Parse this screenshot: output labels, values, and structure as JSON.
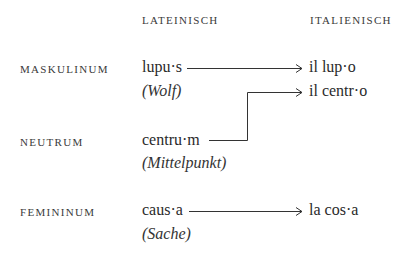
{
  "headers": {
    "latin": "LATEINISCH",
    "italian": "ITALIENISCH"
  },
  "rows": [
    {
      "gender": "MASKULINUM",
      "latin": "lupu·s",
      "gloss": "(Wolf)",
      "italian": "il lup·o"
    },
    {
      "gender": "NEUTRUM",
      "latin": "centru·m",
      "gloss": "(Mittelpunkt)",
      "italian": "il centr·o"
    },
    {
      "gender": "FEMININUM",
      "latin": "caus·a",
      "gloss": "(Sache)",
      "italian": "la cos·a"
    }
  ],
  "colors": {
    "text": "#2a2a2a",
    "line": "#333333"
  }
}
